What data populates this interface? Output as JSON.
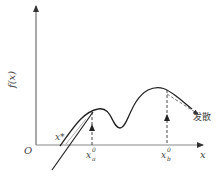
{
  "diagram": {
    "title": "",
    "y_axis_label": "f(x)",
    "x_axis_label": "x",
    "origin_label": "O",
    "root_label": "x*",
    "start_point_a": {
      "label": "x",
      "superscript": "0",
      "subscript": "a"
    },
    "start_point_b": {
      "label": "x",
      "superscript": "0",
      "subscript": "b"
    },
    "divergence_label": "发散",
    "colors": {
      "line": "#333333",
      "text": "#444444",
      "background": "#ffffff"
    }
  }
}
